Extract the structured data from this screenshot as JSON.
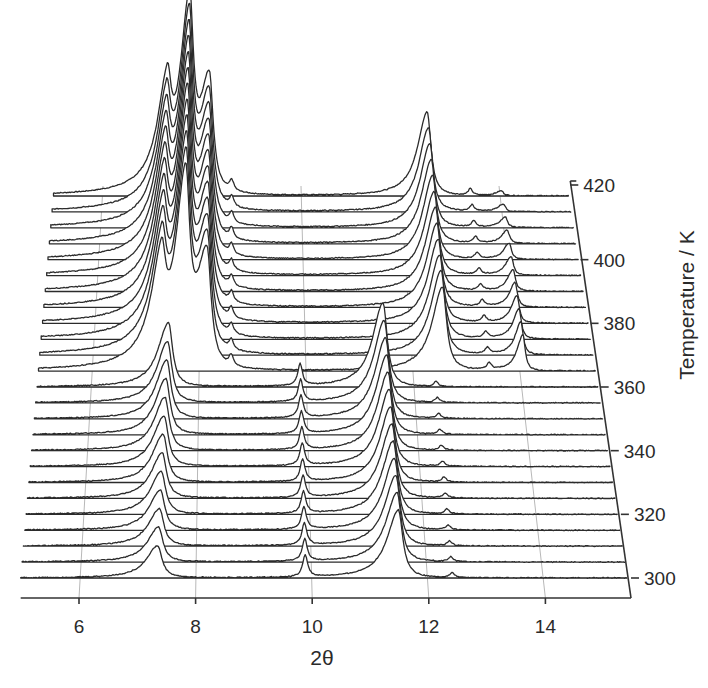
{
  "chart_data": {
    "type": "waterfall",
    "title": "",
    "xlabel": "2θ",
    "zlabel": "Temperature / K",
    "xlim": [
      5.0,
      15.4
    ],
    "x_ticks": [
      6,
      8,
      10,
      12,
      14
    ],
    "z_ticks": [
      300,
      320,
      340,
      360,
      380,
      400,
      420
    ],
    "temperatures": [
      300,
      305,
      310,
      315,
      320,
      325,
      330,
      335,
      340,
      345,
      350,
      355,
      360,
      365,
      370,
      375,
      380,
      385,
      390,
      395,
      400,
      405,
      410,
      415,
      420
    ],
    "phase_transition_K": 362,
    "grid": true,
    "phases": [
      {
        "name": "low-temperature phase",
        "range_K": [
          300,
          360
        ],
        "peaks": [
          {
            "two_theta": 7.35,
            "height_rel_start": 0.4,
            "height_rel_end": 0.8,
            "shift_per_K": 0.0015,
            "width": 0.09,
            "asym": "left"
          },
          {
            "two_theta": 9.88,
            "height_rel": 0.28,
            "width": 0.05
          },
          {
            "two_theta": 11.48,
            "height_rel_start": 0.85,
            "height_rel_end": 1.05,
            "shift_per_K": -0.001,
            "width": 0.09,
            "asym": "left"
          },
          {
            "two_theta": 12.4,
            "height_rel": 0.06,
            "width": 0.05
          }
        ]
      },
      {
        "name": "high-temperature phase",
        "range_K": [
          365,
          420
        ],
        "peaks": [
          {
            "two_theta": 7.3,
            "height_rel": 1.1,
            "width": 0.09,
            "asym": "left"
          },
          {
            "two_theta": 7.75,
            "height_rel": 2.2,
            "width": 0.09,
            "asym": "left"
          },
          {
            "two_theta": 8.15,
            "height_rel": 1.45,
            "width": 0.09,
            "asym": "left"
          },
          {
            "two_theta": 8.6,
            "height_rel": 0.13,
            "width": 0.05
          },
          {
            "two_theta": 12.55,
            "height_rel": 1.05,
            "width": 0.09,
            "asym": "left"
          },
          {
            "two_theta": 13.42,
            "height_rel": 0.08,
            "width": 0.05
          },
          {
            "two_theta": 14.05,
            "height_rel_start": 0.45,
            "height_rel_end": 0.06,
            "width": 0.05,
            "asym": "left"
          }
        ]
      }
    ]
  },
  "axes": {
    "x_title": "2θ",
    "z_title": "Temperature / K",
    "x_tick_labels": [
      "6",
      "8",
      "10",
      "12",
      "14"
    ],
    "z_tick_labels": [
      "300",
      "320",
      "340",
      "360",
      "380",
      "400",
      "420"
    ]
  },
  "geometry": {
    "front": {
      "y": 578,
      "x_at_6": 79,
      "px_per_unit": 58.3
    },
    "back": {
      "y": 196,
      "x_at_6": 103,
      "px_per_unit": 49.5
    },
    "intensity_scale_px": 80
  }
}
